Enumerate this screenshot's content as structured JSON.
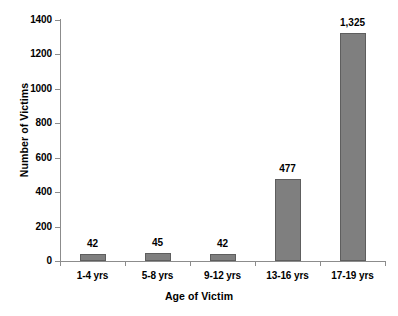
{
  "chart_data": {
    "type": "bar",
    "title": "",
    "categories": [
      "1-4 yrs",
      "5-8 yrs",
      "9-12 yrs",
      "13-16 yrs",
      "17-19 yrs"
    ],
    "values": [
      42,
      45,
      42,
      477,
      1325
    ],
    "value_labels": [
      "42",
      "45",
      "42",
      "477",
      "1,325"
    ],
    "xlabel": "Age of Victim",
    "ylabel": "Number of Victims",
    "ylim": [
      0,
      1400
    ],
    "ytick_values": [
      0,
      200,
      400,
      600,
      800,
      1000,
      1200,
      1400
    ],
    "ytick_labels": [
      "0",
      "200",
      "400",
      "600",
      "800",
      "1000",
      "1200",
      "1400"
    ],
    "grid": false,
    "legend": false,
    "bar_color": "#7f7f7f",
    "bar_border_color": "#5e5e5e",
    "axis_color": "#8c8c8c",
    "background_color": "#ffffff"
  }
}
